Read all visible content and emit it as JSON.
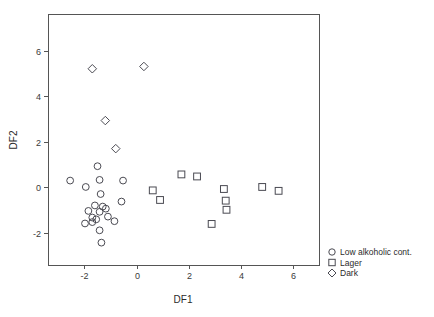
{
  "chart_data": {
    "type": "scatter",
    "title": "",
    "xlabel": "DF1",
    "ylabel": "DF2",
    "xlim": [
      -3.4,
      7.0
    ],
    "ylim": [
      -3.4,
      7.6
    ],
    "xticks": [
      -2,
      0,
      2,
      4,
      6
    ],
    "xticklabels": [
      "-2",
      "0",
      "2",
      "4",
      "6"
    ],
    "yticks": [
      -2,
      0,
      2,
      4,
      6
    ],
    "yticklabels": [
      "-2",
      "0",
      "2",
      "4",
      "6"
    ],
    "grid": false,
    "legend_position": "outside-bottom-right",
    "series": [
      {
        "name": "Low alkoholic cont.",
        "marker": "circle",
        "points": [
          [
            -2.55,
            0.3
          ],
          [
            -1.95,
            0.02
          ],
          [
            -1.5,
            0.93
          ],
          [
            -1.42,
            0.33
          ],
          [
            -1.38,
            -0.29
          ],
          [
            -1.6,
            -0.79
          ],
          [
            -1.42,
            -1.07
          ],
          [
            -1.3,
            -0.84
          ],
          [
            -1.18,
            -0.93
          ],
          [
            -1.85,
            -1.03
          ],
          [
            -1.7,
            -1.32
          ],
          [
            -1.55,
            -1.4
          ],
          [
            -1.98,
            -1.58
          ],
          [
            -1.7,
            -1.52
          ],
          [
            -1.42,
            -1.88
          ],
          [
            -1.35,
            -2.42
          ],
          [
            -0.85,
            -1.48
          ],
          [
            -0.58,
            -0.62
          ],
          [
            -0.52,
            0.3
          ],
          [
            -1.1,
            -1.28
          ]
        ]
      },
      {
        "name": "Lager",
        "marker": "square",
        "points": [
          [
            0.62,
            -0.13
          ],
          [
            0.9,
            -0.55
          ],
          [
            1.72,
            0.57
          ],
          [
            2.32,
            0.48
          ],
          [
            2.88,
            -1.6
          ],
          [
            3.35,
            -0.07
          ],
          [
            3.42,
            -0.58
          ],
          [
            3.45,
            -0.98
          ],
          [
            4.82,
            0.02
          ],
          [
            5.45,
            -0.15
          ]
        ]
      },
      {
        "name": "Dark",
        "marker": "diamond",
        "points": [
          [
            -1.7,
            5.2
          ],
          [
            0.28,
            5.3
          ],
          [
            -1.2,
            2.93
          ],
          [
            -0.8,
            1.7
          ]
        ]
      }
    ]
  },
  "legend": {
    "entries": [
      {
        "label": "Low alkoholic cont.",
        "marker": "circle"
      },
      {
        "label": "Lager",
        "marker": "square"
      },
      {
        "label": "Dark",
        "marker": "diamond"
      }
    ]
  },
  "axes": {
    "x_title": "DF1",
    "y_title": "DF2"
  },
  "colors": {
    "marker_stroke": "#4a4a52",
    "axis": "#555555",
    "text": "#2b2b2b",
    "background": "#ffffff"
  }
}
